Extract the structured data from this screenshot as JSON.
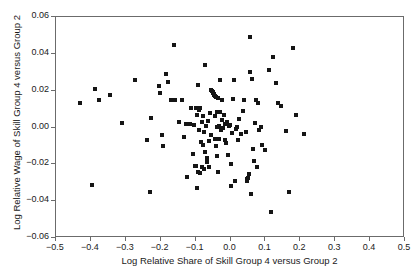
{
  "chart_data": {
    "type": "scatter",
    "title": "",
    "xlabel": "Log Relative Share of Skill Group 4 versus Group 2",
    "ylabel": "Log Relative Wage of Skill Group 4 versus Group 2",
    "xlim": [
      -0.5,
      0.5
    ],
    "ylim": [
      -0.06,
      0.06
    ],
    "xticks": [
      -0.5,
      -0.4,
      -0.3,
      -0.2,
      -0.1,
      0.0,
      0.1,
      0.2,
      0.3,
      0.4,
      0.5
    ],
    "xticklabels": [
      "-0.5",
      "-0.4",
      "-0.3",
      "-0.2",
      "-0.1",
      "0.0",
      "0.1",
      "0.2",
      "0.3",
      "0.4",
      "0.5"
    ],
    "yticks": [
      -0.06,
      -0.04,
      -0.02,
      0.0,
      0.02,
      0.04,
      0.06
    ],
    "yticklabels": [
      "-0.06",
      "-0.04",
      "-0.02",
      "0.00",
      "0.02",
      "0.04",
      "0.06"
    ],
    "grid": false,
    "legend": null,
    "marker": "square",
    "marker_color": "#151515",
    "marker_size": 4,
    "n_points": 131,
    "points": [
      [
        -0.43,
        0.0131
      ],
      [
        -0.398,
        -0.031
      ],
      [
        -0.387,
        0.0211
      ],
      [
        -0.377,
        0.0147
      ],
      [
        -0.345,
        0.0174
      ],
      [
        -0.312,
        0.0022
      ],
      [
        -0.275,
        0.0257
      ],
      [
        -0.238,
        -0.007
      ],
      [
        -0.232,
        -0.0348
      ],
      [
        -0.227,
        0.0054
      ],
      [
        -0.206,
        0.0224
      ],
      [
        -0.203,
        0.019
      ],
      [
        -0.197,
        -0.004
      ],
      [
        -0.193,
        -0.0101
      ],
      [
        -0.186,
        0.0289
      ],
      [
        -0.178,
        0.0247
      ],
      [
        -0.17,
        0.0152
      ],
      [
        -0.163,
        0.0447
      ],
      [
        -0.16,
        0.0149
      ],
      [
        -0.148,
        0.0029
      ],
      [
        -0.139,
        0.015
      ],
      [
        -0.133,
        -0.0053
      ],
      [
        -0.127,
        0.0021
      ],
      [
        -0.124,
        -0.027
      ],
      [
        -0.117,
        0.0019
      ],
      [
        -0.113,
        0.0108
      ],
      [
        -0.108,
        -0.0143
      ],
      [
        -0.105,
        0.0011
      ],
      [
        -0.102,
        -0.021
      ],
      [
        -0.1,
        0.0104
      ],
      [
        -0.098,
        -0.0207
      ],
      [
        -0.096,
        0.0069
      ],
      [
        -0.095,
        -0.0331
      ],
      [
        -0.093,
        0.0233
      ],
      [
        -0.092,
        -0.024
      ],
      [
        -0.09,
        -0.0014
      ],
      [
        -0.089,
        0.0095
      ],
      [
        -0.088,
        0.0108
      ],
      [
        -0.086,
        -0.0246
      ],
      [
        -0.085,
        -0.0078
      ],
      [
        -0.083,
        -0.0212
      ],
      [
        -0.082,
        0.0031
      ],
      [
        -0.08,
        -0.0095
      ],
      [
        -0.079,
        0.0062
      ],
      [
        -0.077,
        -0.0228
      ],
      [
        -0.075,
        -0.0026
      ],
      [
        -0.073,
        0.0342
      ],
      [
        -0.072,
        -0.0132
      ],
      [
        -0.07,
        0.0009
      ],
      [
        -0.068,
        -0.0165
      ],
      [
        -0.066,
        -0.0188
      ],
      [
        -0.064,
        0.0035
      ],
      [
        -0.062,
        -0.0073
      ],
      [
        -0.061,
        -0.0216
      ],
      [
        -0.059,
        0.0077
      ],
      [
        -0.057,
        -0.004
      ],
      [
        -0.055,
        0.0201
      ],
      [
        -0.053,
        0.0198
      ],
      [
        -0.051,
        0.0194
      ],
      [
        -0.05,
        0.019
      ],
      [
        -0.049,
        0.0186
      ],
      [
        -0.048,
        0.0183
      ],
      [
        -0.047,
        0.018
      ],
      [
        -0.046,
        0.0176
      ],
      [
        -0.045,
        0.017
      ],
      [
        -0.044,
        0.006
      ],
      [
        -0.043,
        -0.0062
      ],
      [
        -0.042,
        0.0165
      ],
      [
        -0.041,
        -0.01
      ],
      [
        -0.04,
        0.0082
      ],
      [
        -0.039,
        0.0002
      ],
      [
        -0.038,
        -0.0155
      ],
      [
        -0.036,
        -0.0241
      ],
      [
        -0.035,
        0.016
      ],
      [
        -0.034,
        0.0006
      ],
      [
        -0.032,
        -0.0063
      ],
      [
        -0.03,
        0.0257
      ],
      [
        -0.029,
        0.0085
      ],
      [
        -0.027,
        -0.0012
      ],
      [
        -0.025,
        0.0043
      ],
      [
        -0.023,
        0.0152
      ],
      [
        -0.021,
        -0.0005
      ],
      [
        -0.019,
        0.0068
      ],
      [
        -0.017,
        -0.007
      ],
      [
        -0.015,
        0.0017
      ],
      [
        -0.013,
        -0.0083
      ],
      [
        -0.01,
        0.003
      ],
      [
        -0.008,
        -0.0148
      ],
      [
        -0.005,
        0.0008
      ],
      [
        -0.002,
        0.0014
      ],
      [
        0.0,
        -0.0196
      ],
      [
        0.002,
        -0.032
      ],
      [
        0.005,
        -0.003
      ],
      [
        0.008,
        0.0154
      ],
      [
        0.01,
        0.0257
      ],
      [
        0.012,
        -0.0293
      ],
      [
        0.015,
        -0.0009
      ],
      [
        0.018,
        0.0001
      ],
      [
        0.021,
        -0.0068
      ],
      [
        0.024,
        0.0045
      ],
      [
        0.03,
        -0.0038
      ],
      [
        0.035,
        0.0091
      ],
      [
        0.04,
        0.0152
      ],
      [
        0.044,
        -0.0026
      ],
      [
        0.046,
        -0.0279
      ],
      [
        0.048,
        -0.0289
      ],
      [
        0.05,
        -0.0273
      ],
      [
        0.052,
        -0.0251
      ],
      [
        0.055,
        0.0489
      ],
      [
        0.057,
        0.0304
      ],
      [
        0.059,
        -0.036
      ],
      [
        0.062,
        0.0265
      ],
      [
        0.065,
        -0.0117
      ],
      [
        0.068,
        -0.0182
      ],
      [
        0.071,
        0.0024
      ],
      [
        0.074,
        0.0152
      ],
      [
        0.077,
        -0.0214
      ],
      [
        0.08,
        0.0132
      ],
      [
        0.083,
        -0.0013
      ],
      [
        0.086,
        0.0003
      ],
      [
        0.091,
        -0.0096
      ],
      [
        0.1,
        -0.0122
      ],
      [
        0.11,
        0.0312
      ],
      [
        0.115,
        -0.0458
      ],
      [
        0.122,
        0.0385
      ],
      [
        0.13,
        0.0243
      ],
      [
        0.137,
        0.0132
      ],
      [
        0.145,
        0.0119
      ],
      [
        0.158,
        -0.0021
      ],
      [
        0.168,
        -0.035
      ],
      [
        0.178,
        0.043
      ],
      [
        0.188,
        0.0066
      ],
      [
        0.212,
        -0.0037
      ]
    ]
  }
}
